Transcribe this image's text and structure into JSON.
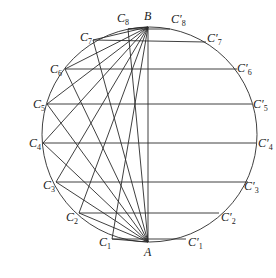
{
  "diagram": {
    "title": "",
    "circle": {
      "cx": 149.5,
      "cy": 134.5,
      "r": 107.5
    },
    "points": {
      "A": {
        "label": "A",
        "x": 148,
        "y": 242,
        "lx": 144,
        "ly": 256
      },
      "B": {
        "label": "B",
        "x": 148,
        "y": 27,
        "lx": 144,
        "ly": 20
      }
    },
    "left_points": [
      {
        "name": "C",
        "sub": "1",
        "x": 112,
        "y": 239,
        "lx": 99,
        "ly": 246
      },
      {
        "name": "C",
        "sub": "2",
        "x": 79,
        "y": 213,
        "lx": 66,
        "ly": 221
      },
      {
        "name": "C",
        "sub": "3",
        "x": 56,
        "y": 182,
        "lx": 43,
        "ly": 189
      },
      {
        "name": "C",
        "sub": "4",
        "x": 43,
        "y": 143,
        "lx": 29,
        "ly": 147
      },
      {
        "name": "C",
        "sub": "5",
        "x": 47,
        "y": 104,
        "lx": 33,
        "ly": 108
      },
      {
        "name": "C",
        "sub": "6",
        "x": 65,
        "y": 69,
        "lx": 50,
        "ly": 73
      },
      {
        "name": "C",
        "sub": "7",
        "x": 93,
        "y": 40,
        "lx": 80,
        "ly": 41
      },
      {
        "name": "C",
        "sub": "8",
        "x": 128,
        "y": 29,
        "lx": 117,
        "ly": 22
      }
    ],
    "right_points": [
      {
        "name": "C′",
        "sub": "1",
        "x": 186,
        "y": 239,
        "lx": 188,
        "ly": 246
      },
      {
        "name": "C′",
        "sub": "2",
        "x": 219,
        "y": 213,
        "lx": 221,
        "ly": 221
      },
      {
        "name": "C′",
        "sub": "3",
        "x": 248,
        "y": 182,
        "lx": 244,
        "ly": 190
      },
      {
        "name": "C′",
        "sub": "4",
        "x": 256,
        "y": 143,
        "lx": 258,
        "ly": 147
      },
      {
        "name": "C′",
        "sub": "5",
        "x": 252,
        "y": 104,
        "lx": 253,
        "ly": 108
      },
      {
        "name": "C′",
        "sub": "6",
        "x": 237,
        "y": 69,
        "lx": 237,
        "ly": 72
      },
      {
        "name": "C′",
        "sub": "7",
        "x": 206,
        "y": 42,
        "lx": 207,
        "ly": 42
      },
      {
        "name": "C′",
        "sub": "8",
        "x": 170,
        "y": 29,
        "lx": 171,
        "ly": 23
      }
    ],
    "line_color": "#2a2a2a",
    "background": "#ffffff"
  }
}
